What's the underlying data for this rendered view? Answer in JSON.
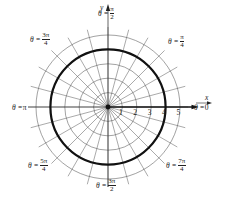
{
  "chart_data": {
    "type": "polar",
    "title": "",
    "center_px": [
      108,
      107
    ],
    "px_per_unit": 14.4,
    "radial_ticks": [
      1,
      2,
      3,
      4,
      5
    ],
    "radial_tick_labels": [
      "1",
      "2",
      "3",
      "4",
      "5"
    ],
    "angular_gridlines_deg_step": 15,
    "angular_gridline_count": 24,
    "axes": {
      "x_label": "x",
      "y_label": "y"
    },
    "angle_labels": [
      {
        "id": "theta_0",
        "text_prefix": "θ = ",
        "num": "0",
        "den": "",
        "x": 194,
        "y": 108
      },
      {
        "id": "theta_pi_4",
        "text_prefix": "θ = ",
        "num": "π",
        "den": "4",
        "x": 168,
        "y": 42
      },
      {
        "id": "theta_pi_2",
        "text_prefix": "θ = ",
        "num": "π",
        "den": "2",
        "x": 98,
        "y": 14
      },
      {
        "id": "theta_3pi_4",
        "text_prefix": "θ = ",
        "num": "3π",
        "den": "4",
        "x": 30,
        "y": 40
      },
      {
        "id": "theta_pi",
        "text_prefix": "θ = ",
        "num": "π",
        "den": "",
        "x": 12,
        "y": 108
      },
      {
        "id": "theta_5pi_4",
        "text_prefix": "θ = ",
        "num": "5π",
        "den": "4",
        "x": 28,
        "y": 166
      },
      {
        "id": "theta_3pi_2",
        "text_prefix": "θ = ",
        "num": "3π",
        "den": "2",
        "x": 96,
        "y": 186
      },
      {
        "id": "theta_7pi_4",
        "text_prefix": "θ = ",
        "num": "7π",
        "den": "4",
        "x": 166,
        "y": 166
      }
    ],
    "series": [
      {
        "name": "r = 4",
        "kind": "circle",
        "r": 4,
        "stroke": "#111111",
        "stroke_width": 2.2
      }
    ],
    "highlighted_ray": {
      "from_r": 0,
      "to_r": 5.8,
      "angle_deg": 0,
      "stroke": "#111111",
      "stroke_width": 1.6
    },
    "grid_color": "#555555",
    "xlabel": "x",
    "ylabel": "y"
  }
}
